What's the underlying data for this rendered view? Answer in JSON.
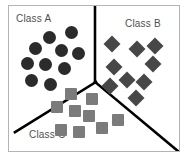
{
  "figure": {
    "background_color": "#ffffff",
    "frame_border_color": "#b4b4b4",
    "partition_line_color": "#000000",
    "partition_line_width": 2
  },
  "labels": {
    "class_a": "Class A",
    "class_b": "Class B",
    "class_c": "Class C"
  },
  "chart_data": {
    "type": "scatter",
    "title": "",
    "xlabel": "",
    "ylabel": "",
    "xlim": [
      0,
      172
    ],
    "ylim": [
      0,
      147
    ],
    "grid": false,
    "legend_position": "in-plot-corners",
    "annotations": [
      {
        "text": "Class A",
        "x": 7,
        "y": 8
      },
      {
        "text": "Class B",
        "x": 116,
        "y": 13
      },
      {
        "text": "Class C",
        "x": 20,
        "y": 124
      }
    ],
    "decision_boundaries": [
      {
        "name": "a-b-divider",
        "points": [
          [
            87,
            77
          ],
          [
            87,
            0
          ]
        ]
      },
      {
        "name": "a-c-divider",
        "points": [
          [
            87,
            77
          ],
          [
            8,
            127
          ]
        ]
      },
      {
        "name": "b-c-divider",
        "points": [
          [
            87,
            77
          ],
          [
            170,
            146
          ]
        ]
      }
    ],
    "series": [
      {
        "name": "Class A",
        "marker": "circle",
        "color": "#2b2b2b",
        "size": 13,
        "count": 10,
        "points": [
          [
            40,
            31
          ],
          [
            62,
            26
          ],
          [
            26,
            42
          ],
          [
            52,
            44
          ],
          [
            69,
            47
          ],
          [
            18,
            57
          ],
          [
            36,
            58
          ],
          [
            55,
            62
          ],
          [
            22,
            74
          ],
          [
            41,
            78
          ]
        ]
      },
      {
        "name": "Class B",
        "marker": "diamond",
        "color": "#474747",
        "size": 12,
        "count": 9,
        "points": [
          [
            103,
            38
          ],
          [
            128,
            43
          ],
          [
            146,
            40
          ],
          [
            105,
            61
          ],
          [
            144,
            58
          ],
          [
            101,
            80
          ],
          [
            118,
            74
          ],
          [
            135,
            76
          ],
          [
            127,
            92
          ]
        ]
      },
      {
        "name": "Class C",
        "marker": "square",
        "color": "#7b7b7b",
        "size": 12,
        "count": 9,
        "points": [
          [
            62,
            88
          ],
          [
            48,
            101
          ],
          [
            66,
            105
          ],
          [
            83,
            93
          ],
          [
            80,
            110
          ],
          [
            109,
            114
          ],
          [
            70,
            126
          ],
          [
            93,
            122
          ],
          [
            52,
            124
          ]
        ]
      }
    ]
  }
}
